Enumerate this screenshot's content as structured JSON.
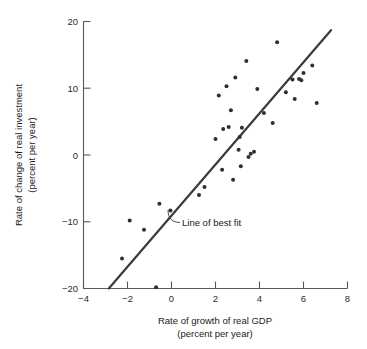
{
  "figure": {
    "title_fragment": "",
    "background": "#ffffff",
    "ink_color": "#2f2f33",
    "axis_color": "#58585a"
  },
  "annotations": [
    {
      "name": "line-of-best-fit-label",
      "text": "Line of best fit"
    }
  ],
  "axes": {
    "x": {
      "label_line1": "Rate of growth of real GDP",
      "label_line2": "(percent per year)",
      "ticks": [
        "−4",
        "−2",
        "0",
        "2",
        "4",
        "6",
        "8"
      ],
      "tick_values": [
        -4,
        -2,
        0,
        2,
        4,
        6,
        8
      ],
      "min": -4,
      "max": 8
    },
    "y": {
      "label_line1": "Rate of change of real investment",
      "label_line2": "(percent per year)",
      "ticks": [
        "20",
        "10",
        "0",
        "−10",
        "−20"
      ],
      "tick_values": [
        20,
        10,
        0,
        -10,
        -20
      ],
      "min": -20,
      "max": 20
    }
  },
  "chart_data": {
    "type": "scatter",
    "title": "",
    "xlabel": "Rate of growth of real GDP (percent per year)",
    "ylabel": "Rate of change of real investment (percent per year)",
    "xlim": [
      -4,
      8
    ],
    "ylim": [
      -20,
      20
    ],
    "xticks": [
      -4,
      -2,
      0,
      2,
      4,
      6,
      8
    ],
    "yticks": [
      -20,
      -10,
      0,
      10,
      20
    ],
    "grid": false,
    "legend": "none",
    "points": [
      [
        -2.25,
        -15.5
      ],
      [
        -1.9,
        -9.8
      ],
      [
        -1.25,
        -11.2
      ],
      [
        -0.7,
        -19.8
      ],
      [
        -0.55,
        -7.3
      ],
      [
        -0.05,
        -8.3
      ],
      [
        1.25,
        -6.0
      ],
      [
        1.5,
        -4.8
      ],
      [
        2.0,
        2.4
      ],
      [
        2.15,
        8.9
      ],
      [
        2.3,
        -2.2
      ],
      [
        2.35,
        3.9
      ],
      [
        2.5,
        10.3
      ],
      [
        2.6,
        4.2
      ],
      [
        2.7,
        6.7
      ],
      [
        2.8,
        -3.7
      ],
      [
        2.9,
        11.6
      ],
      [
        3.05,
        0.8
      ],
      [
        3.1,
        2.7
      ],
      [
        3.15,
        -1.7
      ],
      [
        3.2,
        4.1
      ],
      [
        3.4,
        14.1
      ],
      [
        3.5,
        -0.3
      ],
      [
        3.6,
        0.2
      ],
      [
        3.75,
        0.5
      ],
      [
        3.9,
        9.9
      ],
      [
        4.2,
        6.3
      ],
      [
        4.6,
        4.8
      ],
      [
        4.8,
        16.9
      ],
      [
        5.2,
        9.4
      ],
      [
        5.5,
        11.3
      ],
      [
        5.6,
        8.4
      ],
      [
        5.8,
        11.4
      ],
      [
        5.9,
        11.2
      ],
      [
        6.0,
        12.3
      ],
      [
        6.4,
        13.4
      ],
      [
        6.6,
        7.8
      ]
    ],
    "fit_line": {
      "label": "Line of best fit",
      "x_start": -2.85,
      "y_start": -20.0,
      "x_end": 7.25,
      "y_end": 18.7
    }
  }
}
